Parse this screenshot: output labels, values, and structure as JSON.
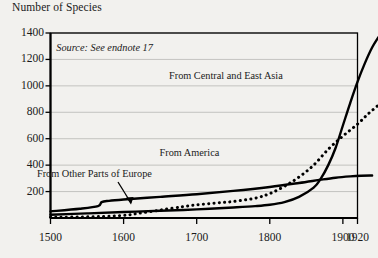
{
  "axis_title": "Number of Species",
  "source_note": "Source: See endnote 17",
  "annotations": {
    "asia": "From Central and East Asia",
    "america": "From America",
    "europe": "From Other Parts of Europe"
  },
  "chart_data": {
    "type": "line",
    "title": "",
    "subtitle": "",
    "xlabel": "",
    "ylabel": "Number of Species",
    "xlim": [
      1500,
      1920
    ],
    "ylim": [
      0,
      1400
    ],
    "xticks": [
      1500,
      1600,
      1700,
      1800,
      1900,
      1920
    ],
    "xtick_labels": [
      "1500",
      "1600",
      "1700",
      "1800",
      "1900",
      "1920"
    ],
    "yticks": [
      200,
      400,
      600,
      800,
      1000,
      1200,
      1400
    ],
    "ytick_labels": [
      "200",
      "400",
      "600",
      "800",
      "1000",
      "1200",
      "1400"
    ],
    "grid": "horizontal",
    "legend": "inline-annotations",
    "colors": {
      "line": "#000000",
      "grid": "#b8b8b4",
      "frame": "#000000",
      "background": "#f2f1ee"
    },
    "series": [
      {
        "name": "From Central and East Asia",
        "style": "solid",
        "label_x": 1740,
        "label_y": 1075,
        "x": [
          1500,
          1550,
          1600,
          1650,
          1700,
          1750,
          1780,
          1800,
          1820,
          1840,
          1860,
          1870,
          1880,
          1890,
          1900,
          1910,
          1920,
          1930,
          1940,
          1950
        ],
        "values": [
          25,
          35,
          45,
          55,
          65,
          80,
          90,
          100,
          120,
          160,
          230,
          300,
          400,
          530,
          700,
          870,
          1030,
          1170,
          1290,
          1380
        ]
      },
      {
        "name": "From America",
        "style": "dotted",
        "label_x": 1690,
        "label_y": 490,
        "x": [
          1500,
          1560,
          1600,
          1620,
          1650,
          1680,
          1700,
          1730,
          1750,
          1780,
          1800,
          1820,
          1840,
          1860,
          1880,
          1900,
          1920,
          1935,
          1950
        ],
        "values": [
          5,
          10,
          20,
          35,
          60,
          85,
          100,
          115,
          125,
          150,
          185,
          240,
          310,
          400,
          520,
          620,
          710,
          790,
          860
        ]
      },
      {
        "name": "From Other Parts of Europe",
        "style": "solid",
        "label_x": 1560,
        "label_y": 330,
        "x": [
          1500,
          1540,
          1565,
          1570,
          1580,
          1600,
          1650,
          1700,
          1750,
          1800,
          1840,
          1870,
          1890,
          1910,
          1925,
          1940
        ],
        "values": [
          50,
          70,
          90,
          120,
          130,
          140,
          160,
          180,
          205,
          235,
          265,
          290,
          305,
          315,
          320,
          322
        ]
      }
    ]
  }
}
